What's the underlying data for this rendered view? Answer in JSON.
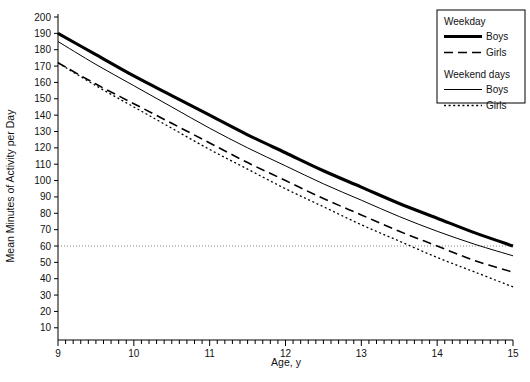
{
  "chart_data": {
    "type": "line",
    "title": "",
    "xlabel": "Age, y",
    "ylabel": "Mean Minutes of Activity per Day",
    "xlim": [
      9,
      15
    ],
    "ylim": [
      3,
      200
    ],
    "xticks": [
      9,
      10,
      11,
      12,
      13,
      14,
      15
    ],
    "xtick_labels": [
      "9",
      "10",
      "11",
      "12",
      "13",
      "14",
      "15"
    ],
    "yticks": [
      10,
      20,
      30,
      40,
      50,
      60,
      70,
      80,
      90,
      100,
      110,
      120,
      130,
      140,
      150,
      160,
      170,
      180,
      190,
      200
    ],
    "ytick_labels": [
      "10",
      "20",
      "30",
      "40",
      "50",
      "60",
      "70",
      "80",
      "90",
      "100",
      "110",
      "120",
      "130",
      "140",
      "150",
      "160",
      "170",
      "180",
      "190",
      "200"
    ],
    "grid": false,
    "minor_ticks_per_interval": 10,
    "reference_lines": [
      {
        "axis": "y",
        "value": 60,
        "style": "dotted",
        "label": "60 minutes"
      }
    ],
    "legend_position": "top-right",
    "x": [
      9,
      9.5,
      10,
      10.5,
      11,
      11.5,
      12,
      12.5,
      13,
      13.5,
      14,
      14.5,
      15
    ],
    "series": [
      {
        "name": "Boys",
        "group": "Weekday",
        "style": "thick-solid",
        "color": "#000000",
        "values": [
          190,
          177,
          164,
          152,
          140,
          128,
          117,
          106,
          96,
          86,
          77,
          68,
          60
        ]
      },
      {
        "name": "Girls",
        "group": "Weekday",
        "style": "dashed",
        "color": "#000000",
        "values": [
          172,
          159,
          147,
          135,
          123,
          111,
          100,
          89,
          79,
          69,
          60,
          51,
          44
        ]
      },
      {
        "name": "Boys",
        "group": "Weekend days",
        "style": "thin-solid",
        "color": "#000000",
        "values": [
          185,
          171,
          158,
          145,
          132,
          120,
          109,
          98,
          88,
          78,
          69,
          61,
          54
        ]
      },
      {
        "name": "Girls",
        "group": "Weekend days",
        "style": "dotted",
        "color": "#000000",
        "values": [
          172,
          158,
          145,
          132,
          119,
          107,
          95,
          84,
          73,
          63,
          53,
          44,
          35
        ]
      }
    ]
  },
  "legend": {
    "groups": [
      {
        "heading": "Weekday",
        "entries": [
          {
            "label": "Boys",
            "style": "thick-solid"
          },
          {
            "label": "Girls",
            "style": "dashed"
          }
        ]
      },
      {
        "heading": "Weekend days",
        "entries": [
          {
            "label": "Boys",
            "style": "thin-solid"
          },
          {
            "label": "Girls",
            "style": "dotted"
          }
        ]
      }
    ]
  },
  "axes": {
    "x_title": "Age, y",
    "y_title": "Mean Minutes of Activity per Day"
  }
}
